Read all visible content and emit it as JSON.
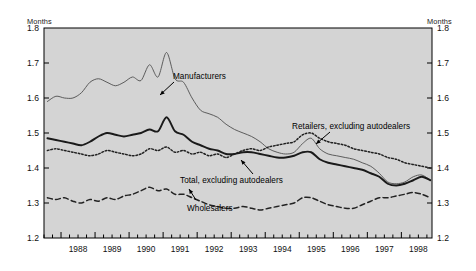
{
  "chart_data": {
    "type": "line",
    "title": "",
    "xlabel": "",
    "ylabel": "Months",
    "ylabel_right": "Months",
    "ylim": [
      1.2,
      1.8
    ],
    "xlim": [
      1987.5,
      1998.9
    ],
    "grid": false,
    "legend_position": "inline-annotations",
    "yticks": [
      "1.8",
      "1.7",
      "1.6",
      "1.5",
      "1.4",
      "1.3",
      "1.2"
    ],
    "ytick_values": [
      1.8,
      1.7,
      1.6,
      1.5,
      1.4,
      1.3,
      1.2
    ],
    "xticks": [
      "1988",
      "1989",
      "1990",
      "1991",
      "1992",
      "1993",
      "1994",
      "1995",
      "1996",
      "1997",
      "1998"
    ],
    "xtick_values": [
      1988,
      1989,
      1990,
      1991,
      1992,
      1993,
      1994,
      1995,
      1996,
      1997,
      1998
    ],
    "minor_tick_interval_quarters": 1,
    "series": [
      {
        "name": "Manufacturers",
        "style": "thin-solid",
        "color": "#555555",
        "x": [
          1987.6,
          1987.85,
          1988.1,
          1988.35,
          1988.6,
          1988.85,
          1989.1,
          1989.35,
          1989.6,
          1989.85,
          1990.1,
          1990.35,
          1990.6,
          1990.85,
          1991.1,
          1991.35,
          1991.6,
          1991.85,
          1992.1,
          1992.35,
          1992.6,
          1992.85,
          1993.1,
          1993.35,
          1993.6,
          1993.85,
          1994.1,
          1994.35,
          1994.6,
          1994.85,
          1995.1,
          1995.35,
          1995.6,
          1995.85,
          1996.1,
          1996.35,
          1996.6,
          1996.85,
          1997.1,
          1997.35,
          1997.6,
          1997.85,
          1998.1,
          1998.35,
          1998.6,
          1998.85
        ],
        "y": [
          1.59,
          1.605,
          1.6,
          1.6,
          1.615,
          1.645,
          1.655,
          1.645,
          1.635,
          1.645,
          1.66,
          1.65,
          1.695,
          1.66,
          1.73,
          1.655,
          1.645,
          1.6,
          1.565,
          1.555,
          1.545,
          1.525,
          1.51,
          1.5,
          1.49,
          1.475,
          1.455,
          1.445,
          1.44,
          1.445,
          1.47,
          1.485,
          1.455,
          1.44,
          1.435,
          1.43,
          1.425,
          1.415,
          1.405,
          1.385,
          1.36,
          1.355,
          1.36,
          1.375,
          1.38,
          1.365
        ]
      },
      {
        "name": "Retailers, excluding autodealers",
        "style": "fine-dotted",
        "color": "#202020",
        "x": [
          1987.6,
          1987.85,
          1988.1,
          1988.35,
          1988.6,
          1988.85,
          1989.1,
          1989.35,
          1989.6,
          1989.85,
          1990.1,
          1990.35,
          1990.6,
          1990.85,
          1991.1,
          1991.35,
          1991.6,
          1991.85,
          1992.1,
          1992.35,
          1992.6,
          1992.85,
          1993.1,
          1993.35,
          1993.6,
          1993.85,
          1994.1,
          1994.35,
          1994.6,
          1994.85,
          1995.1,
          1995.35,
          1995.6,
          1995.85,
          1996.1,
          1996.35,
          1996.6,
          1996.85,
          1997.1,
          1997.35,
          1997.6,
          1997.85,
          1998.1,
          1998.35,
          1998.6,
          1998.85
        ],
        "y": [
          1.45,
          1.455,
          1.45,
          1.445,
          1.44,
          1.435,
          1.44,
          1.45,
          1.445,
          1.44,
          1.435,
          1.44,
          1.455,
          1.45,
          1.46,
          1.445,
          1.45,
          1.44,
          1.445,
          1.435,
          1.44,
          1.43,
          1.44,
          1.45,
          1.455,
          1.45,
          1.46,
          1.465,
          1.47,
          1.475,
          1.495,
          1.5,
          1.485,
          1.475,
          1.47,
          1.465,
          1.455,
          1.45,
          1.445,
          1.44,
          1.43,
          1.425,
          1.415,
          1.41,
          1.405,
          1.4
        ]
      },
      {
        "name": "Total, excluding autodealers",
        "style": "thick-solid",
        "color": "#1a1a1a",
        "x": [
          1987.6,
          1987.85,
          1988.1,
          1988.35,
          1988.6,
          1988.85,
          1989.1,
          1989.35,
          1989.6,
          1989.85,
          1990.1,
          1990.35,
          1990.6,
          1990.85,
          1991.1,
          1991.35,
          1991.6,
          1991.85,
          1992.1,
          1992.35,
          1992.6,
          1992.85,
          1993.1,
          1993.35,
          1993.6,
          1993.85,
          1994.1,
          1994.35,
          1994.6,
          1994.85,
          1995.1,
          1995.35,
          1995.6,
          1995.85,
          1996.1,
          1996.35,
          1996.6,
          1996.85,
          1997.1,
          1997.35,
          1997.6,
          1997.85,
          1998.1,
          1998.35,
          1998.6,
          1998.85
        ],
        "y": [
          1.485,
          1.48,
          1.475,
          1.47,
          1.465,
          1.475,
          1.49,
          1.5,
          1.495,
          1.49,
          1.495,
          1.5,
          1.51,
          1.505,
          1.545,
          1.505,
          1.495,
          1.475,
          1.465,
          1.455,
          1.45,
          1.44,
          1.44,
          1.445,
          1.445,
          1.44,
          1.435,
          1.43,
          1.43,
          1.435,
          1.445,
          1.445,
          1.425,
          1.415,
          1.41,
          1.405,
          1.4,
          1.395,
          1.385,
          1.375,
          1.355,
          1.35,
          1.355,
          1.365,
          1.375,
          1.365
        ]
      },
      {
        "name": "Wholesalers",
        "style": "dashed",
        "color": "#222222",
        "x": [
          1987.6,
          1987.85,
          1988.1,
          1988.35,
          1988.6,
          1988.85,
          1989.1,
          1989.35,
          1989.6,
          1989.85,
          1990.1,
          1990.35,
          1990.6,
          1990.85,
          1991.1,
          1991.35,
          1991.6,
          1991.85,
          1992.1,
          1992.35,
          1992.6,
          1992.85,
          1993.1,
          1993.35,
          1993.6,
          1993.85,
          1994.1,
          1994.35,
          1994.6,
          1994.85,
          1995.1,
          1995.35,
          1995.6,
          1995.85,
          1996.1,
          1996.35,
          1996.6,
          1996.85,
          1997.1,
          1997.35,
          1997.6,
          1997.85,
          1998.1,
          1998.35,
          1998.6,
          1998.85
        ],
        "y": [
          1.315,
          1.31,
          1.315,
          1.305,
          1.3,
          1.31,
          1.305,
          1.315,
          1.31,
          1.32,
          1.325,
          1.335,
          1.345,
          1.335,
          1.34,
          1.325,
          1.325,
          1.315,
          1.305,
          1.295,
          1.29,
          1.285,
          1.285,
          1.29,
          1.285,
          1.28,
          1.285,
          1.29,
          1.295,
          1.3,
          1.315,
          1.315,
          1.305,
          1.295,
          1.29,
          1.285,
          1.285,
          1.295,
          1.305,
          1.315,
          1.315,
          1.32,
          1.325,
          1.33,
          1.325,
          1.315
        ]
      }
    ],
    "annotations": [
      {
        "text": "Manufacturers",
        "x_px": 173,
        "y_px": 72
      },
      {
        "text": "Retailers, excluding autodealers",
        "x_px": 292,
        "y_px": 122
      },
      {
        "text": "Total, excluding autodealers",
        "x_px": 180,
        "y_px": 176
      },
      {
        "text": "Wholesalers",
        "x_px": 187,
        "y_px": 204
      }
    ]
  },
  "colors": {
    "plot_background": "#d4d4d4",
    "page_background": "#ffffff",
    "axis": "#000000",
    "text": "#111111"
  }
}
